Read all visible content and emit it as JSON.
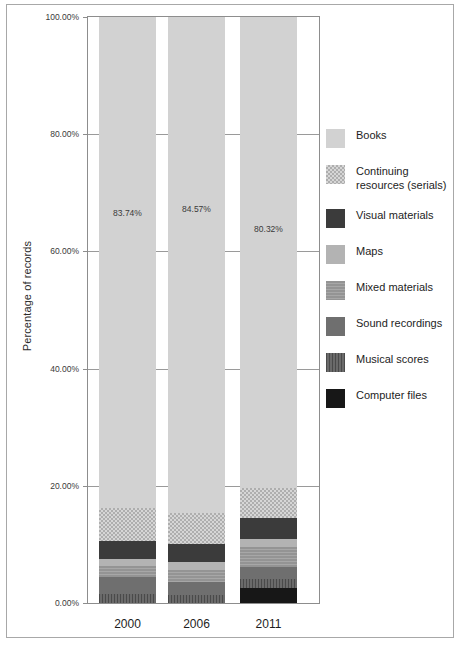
{
  "chart_data": {
    "type": "bar",
    "subtype": "stacked-bar-100-percent",
    "title": "",
    "xlabel": "",
    "ylabel": "Percentage of records",
    "categories": [
      "2000",
      "2006",
      "2011"
    ],
    "ylim": [
      0,
      100
    ],
    "ytick_labels": [
      "0.00%",
      "20.00%",
      "40.00%",
      "60.00%",
      "80.00%",
      "100.00%"
    ],
    "ytick_values": [
      0,
      20,
      40,
      60,
      80,
      100
    ],
    "grid": true,
    "legend_position": "right",
    "bar_value_labels": [
      "83.74%",
      "84.57%",
      "80.32%"
    ],
    "series": [
      {
        "name": "Books",
        "pattern": "solid-light-gray",
        "color": "#d2d2d2",
        "values": [
          83.74,
          84.57,
          80.32
        ]
      },
      {
        "name": "Continuing resources (serials)",
        "pattern": "checkerboard",
        "color": "#d6d6d6",
        "values": [
          5.6,
          5.3,
          5.1
        ]
      },
      {
        "name": "Visual materials",
        "pattern": "solid-dark",
        "color": "#3b3b3b",
        "values": [
          3.1,
          3.2,
          3.6
        ]
      },
      {
        "name": "Maps",
        "pattern": "solid-light-mid-gray",
        "color": "#b3b3b3",
        "values": [
          1.2,
          1.3,
          1.5
        ]
      },
      {
        "name": "Mixed materials",
        "pattern": "horizontal-texture",
        "color": "#949494",
        "values": [
          2.0,
          2.1,
          3.4
        ]
      },
      {
        "name": "Sound recordings",
        "pattern": "solid-mid-dark-gray",
        "color": "#6f6f6f",
        "values": [
          2.9,
          2.1,
          2.0
        ]
      },
      {
        "name": "Musical scores",
        "pattern": "vertical-stripes",
        "color": "#6a6a6a",
        "values": [
          1.46,
          1.43,
          1.48
        ]
      },
      {
        "name": "Computer files",
        "pattern": "solid-black",
        "color": "#171717",
        "values": [
          0.0,
          0.0,
          2.6
        ]
      }
    ]
  },
  "legend": {
    "items": [
      {
        "label": "Books"
      },
      {
        "label": "Continuing resources (serials)"
      },
      {
        "label": "Visual materials"
      },
      {
        "label": "Maps"
      },
      {
        "label": "Mixed materials"
      },
      {
        "label": "Sound recordings"
      },
      {
        "label": "Musical scores"
      },
      {
        "label": "Computer files"
      }
    ]
  }
}
